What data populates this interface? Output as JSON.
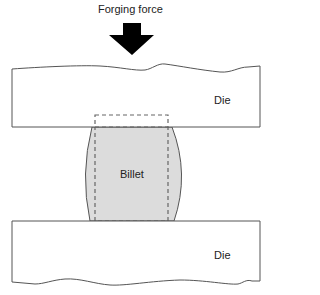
{
  "diagram": {
    "title_label": "Forging force",
    "top_die_label": "Die",
    "bottom_die_label": "Die",
    "billet_label": "Billet",
    "colors": {
      "arrow": "#000000",
      "outline": "#555555",
      "billet_fill": "#dcdcdc",
      "dashed_outline": "#666666",
      "background": "#ffffff"
    },
    "icons": [
      "down-arrow-icon"
    ]
  }
}
